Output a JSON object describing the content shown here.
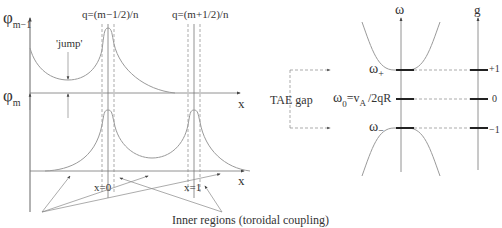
{
  "left_panel": {
    "y_label_top": "φ",
    "y_label_top_sub": "m−1",
    "y_label_bottom": "φ",
    "y_label_bottom_sub": "m",
    "x_label_top": "x",
    "x_label_bottom": "x",
    "jump_label": "'jump'",
    "q_label_left": "q=(m−1/2)/n",
    "q_label_right": "q=(m+1/2)/n",
    "x0_label": "x=0",
    "x1_label": "x=1",
    "inner_regions_label": "Inner regions (toroidal coupling)"
  },
  "middle": {
    "tae_gap_label": "TAE  gap"
  },
  "right_panel": {
    "omega_axis_label": "ω",
    "g_axis_label": "g",
    "omega_plus": "ω",
    "omega_plus_sub": "+",
    "omega_zero": "ω",
    "omega_zero_sub": "0",
    "omega_zero_eq": "=v",
    "omega_zero_eq_sub": "A",
    "omega_zero_rest": "/2qR",
    "omega_minus": "ω",
    "omega_minus_sub": "−",
    "g_plus": "+1",
    "g_zero": "0",
    "g_minus": "−1"
  },
  "colors": {
    "curve": "#9a9a9a",
    "axis": "#555555",
    "level": "#222222",
    "text": "#333333"
  }
}
